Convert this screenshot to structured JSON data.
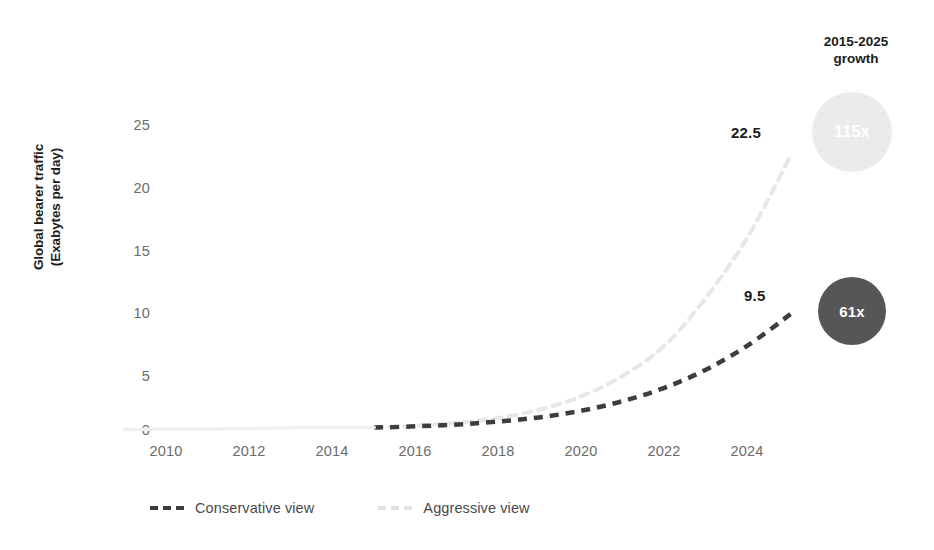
{
  "chart_data": {
    "type": "line",
    "title": "",
    "xlabel": "",
    "ylabel": "Global bearer traffic (Exabytes per day)",
    "ylabel_line1": "Global bearer traffic",
    "ylabel_line2": "(Exabytes per day)",
    "xlim": [
      2009,
      2025.4
    ],
    "ylim": [
      0,
      26
    ],
    "grid": false,
    "legend_position": "bottom",
    "xticks": [
      "2010",
      "2012",
      "2014",
      "2016",
      "2018",
      "2020",
      "2022",
      "2024"
    ],
    "xtick_values": [
      2010,
      2012,
      2014,
      2016,
      2018,
      2020,
      2022,
      2024
    ],
    "yticks": [
      "0",
      "5",
      "10",
      "15",
      "20",
      "25"
    ],
    "ytick_values": [
      0,
      5,
      10,
      15,
      20,
      25
    ],
    "x": [
      2009,
      2010,
      2011,
      2012,
      2013,
      2014,
      2015,
      2016,
      2017,
      2018,
      2019,
      2020,
      2021,
      2022,
      2023,
      2024,
      2025
    ],
    "series": [
      {
        "name": "Conservative view",
        "color": "#3d3d3d",
        "style": "dashed",
        "values": [
          0.04,
          0.06,
          0.09,
          0.13,
          0.18,
          0.2,
          0.2,
          0.3,
          0.45,
          0.7,
          1.05,
          1.6,
          2.4,
          3.5,
          5.0,
          7.0,
          9.5
        ],
        "end_label": "9.5",
        "growth_label": "61x"
      },
      {
        "name": "Aggressive view",
        "color": "#e7e7e7",
        "style": "dashed",
        "values": [
          0.04,
          0.06,
          0.09,
          0.13,
          0.18,
          0.2,
          0.2,
          0.35,
          0.6,
          1.0,
          1.7,
          2.8,
          4.5,
          7.0,
          11.0,
          16.0,
          22.5
        ],
        "end_label": "22.5",
        "growth_label": "115x"
      }
    ],
    "annotations": [
      {
        "text": "22.5",
        "x": 2024.4,
        "y": 23.6
      },
      {
        "text": "9.5",
        "x": 2024.5,
        "y": 10.9
      }
    ]
  },
  "growth_panel": {
    "title_line1": "2015-2025",
    "title_line2": "growth",
    "bubbles": [
      {
        "label": "115x",
        "series": "Aggressive view",
        "color": "#ebebeb"
      },
      {
        "label": "61x",
        "series": "Conservative view",
        "color": "#565656"
      }
    ]
  },
  "legend": {
    "items": [
      {
        "label": "Conservative view",
        "color": "#3d3d3d"
      },
      {
        "label": "Aggressive view",
        "color": "#e2e2e2"
      }
    ]
  }
}
